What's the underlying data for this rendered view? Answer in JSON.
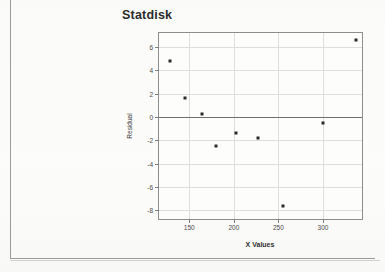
{
  "chart_data": {
    "type": "scatter",
    "title": "Statdisk",
    "xlabel": "X Values",
    "ylabel": "Residual",
    "xlim": [
      116,
      346
    ],
    "ylim": [
      -8.9,
      7.2
    ],
    "grid": true,
    "legend": null,
    "x_ticks": [
      150,
      200,
      250,
      300
    ],
    "x_tick_labels": [
      "150",
      "200",
      "250",
      "300"
    ],
    "y_ticks": [
      6,
      4,
      2,
      0,
      -2,
      -4,
      -6,
      -8
    ],
    "y_tick_labels": [
      "6",
      "4",
      "2",
      "0",
      "-2",
      "-4",
      "-6",
      "-8"
    ],
    "reference_line": {
      "value": 0,
      "orientation": "horizontal"
    },
    "points": [
      {
        "x": 128,
        "y": 4.8
      },
      {
        "x": 145,
        "y": 1.6
      },
      {
        "x": 164,
        "y": 0.25
      },
      {
        "x": 180,
        "y": -2.5
      },
      {
        "x": 202,
        "y": -1.35
      },
      {
        "x": 227,
        "y": -1.75
      },
      {
        "x": 255,
        "y": -7.6
      },
      {
        "x": 300,
        "y": -0.5
      },
      {
        "x": 337,
        "y": 6.6
      }
    ],
    "marker_color": "#2a2a2a",
    "line_color": "#6e6e6e",
    "grid_color": "#dedede",
    "frame_color": "#8d8d8d"
  }
}
